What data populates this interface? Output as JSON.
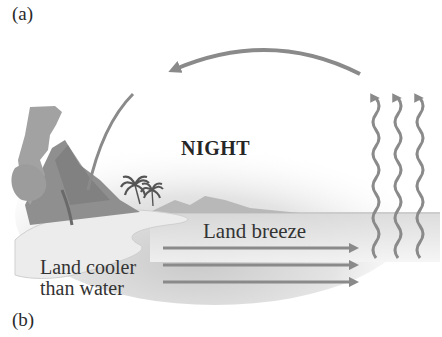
{
  "figure": {
    "panel_labels": {
      "top": "(a)",
      "bottom": "(b)"
    },
    "title": "NIGHT",
    "wind_label": "Land breeze",
    "land_note_line1": "Land cooler",
    "land_note_line2": "than water",
    "elements": {
      "circulation_arrow_top": "arrow flowing from sea (right) to land (left) aloft",
      "circulation_arrow_left": "arrow descending over land",
      "rising_air_arrows": 3,
      "surface_wind_arrows": 3
    },
    "colors": {
      "arrow": "#8a8a8a",
      "text": "#2a2a2a",
      "background": "#ffffff",
      "land_shade": "#9a9a9a",
      "sky_shade": "#dcdcdc"
    }
  }
}
